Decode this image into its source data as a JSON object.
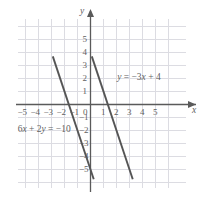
{
  "chart_data": {
    "type": "line",
    "title": "",
    "xlabel": "x",
    "ylabel": "y",
    "xlim": [
      -6.2,
      6.2
    ],
    "ylim": [
      -6.2,
      6.2
    ],
    "grid": true,
    "grid_step": 1,
    "legend": "none",
    "x_ticks": [
      "-5",
      "-4",
      "-3",
      "-2",
      "-1",
      "0",
      "1",
      "2",
      "3",
      "4",
      "5"
    ],
    "x_tick_values": [
      -5,
      -4,
      -3,
      -2,
      -1,
      0,
      1,
      2,
      3,
      4,
      5
    ],
    "y_ticks": [
      "5",
      "4",
      "3",
      "2",
      "1",
      "-1",
      "-2",
      "-3",
      "-4",
      "-5"
    ],
    "y_tick_values": [
      5,
      4,
      3,
      2,
      1,
      -1,
      -2,
      -3,
      -4,
      -5
    ],
    "origin_label": "0",
    "series": [
      {
        "name": "line-a",
        "equation": "6x + 2y = -10",
        "slope": -3,
        "intercept": -5,
        "x_intercept": -1.6667,
        "color": "#555555",
        "points": [
          [
            -2.9,
            3.7
          ],
          [
            0.25,
            -5.75
          ]
        ]
      },
      {
        "name": "line-b",
        "equation": "y = -3x + 4",
        "slope": -3,
        "intercept": 4,
        "x_intercept": 1.3333,
        "color": "#555555",
        "points": [
          [
            0.1,
            3.7
          ],
          [
            3.25,
            -5.75
          ]
        ]
      }
    ],
    "annotations": [
      {
        "id": "eq-line-b",
        "text": "y = −3x + 4",
        "x": 2.05,
        "y": 2.0
      },
      {
        "id": "eq-line-a",
        "text": "6x + 2y = −10",
        "x": -5.6,
        "y": -2.0
      }
    ],
    "colors": {
      "grid": "#dcdce2",
      "axis": "#5a5a5a",
      "line": "#555555",
      "text": "#5f5f5f",
      "background": "#ffffff"
    }
  }
}
